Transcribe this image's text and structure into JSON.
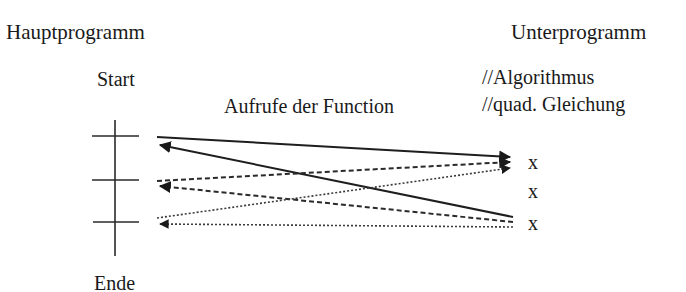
{
  "labels": {
    "main_program": "Hauptprogramm",
    "sub_program": "Unterprogramm",
    "start": "Start",
    "end": "Ende",
    "calls": "Aufrufe der Function",
    "comment_1": "//Algorithmus",
    "comment_2": "//quad. Gleichung",
    "marks": [
      "x",
      "x",
      "x"
    ]
  },
  "diagram": {
    "line_color": "#2a2a2a",
    "call_styles": [
      "solid",
      "dashed",
      "dotted"
    ],
    "call_points": 3,
    "return_points": 3
  }
}
